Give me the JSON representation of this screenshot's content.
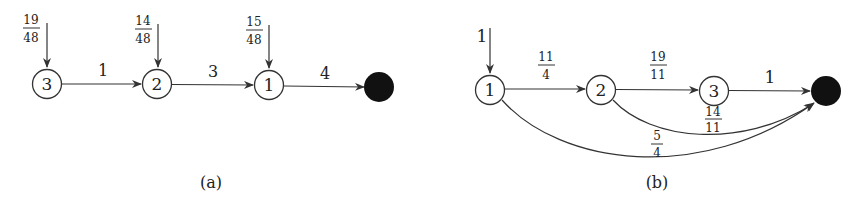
{
  "figures": [
    {
      "caption": "(a)",
      "nodes": [
        {
          "id": "n3",
          "label": "3",
          "x": 47,
          "y": 84
        },
        {
          "id": "n2",
          "label": "2",
          "x": 157,
          "y": 84
        },
        {
          "id": "n1",
          "label": "1",
          "x": 269,
          "y": 85
        },
        {
          "id": "sink",
          "label": "",
          "x": 379,
          "y": 87,
          "filled": true
        }
      ],
      "inputs": [
        {
          "to": "n3",
          "num": "19",
          "den": "48"
        },
        {
          "to": "n2",
          "num": "14",
          "den": "48"
        },
        {
          "to": "n1",
          "num": "15",
          "den": "48"
        }
      ],
      "edges": [
        {
          "from": "n3",
          "to": "n2",
          "label": "1"
        },
        {
          "from": "n2",
          "to": "n1",
          "label": "3"
        },
        {
          "from": "n1",
          "to": "sink",
          "label": "4"
        }
      ]
    },
    {
      "caption": "(b)",
      "nodes": [
        {
          "id": "m1",
          "label": "1",
          "x": 490,
          "y": 90
        },
        {
          "id": "m2",
          "label": "2",
          "x": 601,
          "y": 90
        },
        {
          "id": "m3",
          "label": "3",
          "x": 714,
          "y": 91
        },
        {
          "id": "sink",
          "label": "",
          "x": 826,
          "y": 91,
          "filled": true
        }
      ],
      "inputs": [
        {
          "to": "m1",
          "label": "1"
        }
      ],
      "edges": [
        {
          "from": "m1",
          "to": "m2",
          "num": "11",
          "den": "4"
        },
        {
          "from": "m2",
          "to": "m3",
          "num": "19",
          "den": "11"
        },
        {
          "from": "m3",
          "to": "sink",
          "label": "1"
        },
        {
          "from": "m2",
          "to": "sink",
          "num": "14",
          "den": "11",
          "curved": true
        },
        {
          "from": "m1",
          "to": "sink",
          "num": "5",
          "den": "4",
          "curved": true
        }
      ]
    }
  ]
}
